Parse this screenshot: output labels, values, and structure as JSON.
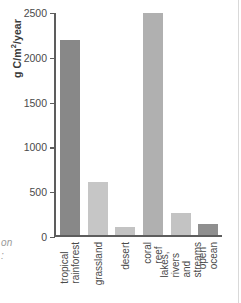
{
  "caption_fragment": "on\n:",
  "chart_data": {
    "type": "bar",
    "title": "",
    "xlabel": "",
    "ylabel": "g C/m²/year",
    "ylabel_main": "g C/m",
    "ylabel_sup": "2",
    "ylabel_tail": "/year",
    "ylim": [
      0,
      2500
    ],
    "grid": false,
    "legend": "none",
    "yticks": [
      0,
      500,
      1000,
      1500,
      2000,
      2500
    ],
    "ytick_labels": [
      "0",
      "500",
      "1000",
      "1500",
      "2000",
      "2500"
    ],
    "categories": [
      "tropical\nrainforest",
      "grassland",
      "desert",
      "coral reef",
      "lakes, rivers\nand streams",
      "open ocean"
    ],
    "values": [
      2200,
      600,
      90,
      2500,
      250,
      125
    ],
    "colors": [
      "#888888",
      "#c6c6c6",
      "#c3c3c3",
      "#b0b0b0",
      "#c3c3c3",
      "#8f8f8f"
    ],
    "axis_color": "#5d5d5d"
  }
}
